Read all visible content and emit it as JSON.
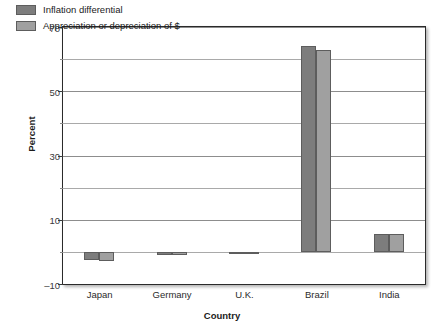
{
  "chart_data": {
    "type": "bar",
    "title": "",
    "xlabel": "Country",
    "ylabel": "Percent",
    "categories": [
      "Japan",
      "Germany",
      "U.K.",
      "Brazil",
      "India"
    ],
    "series": [
      {
        "name": "Inflation differential",
        "color": "#7d7d7d",
        "values": [
          -2.5,
          -1.0,
          -0.4,
          64.0,
          5.5
        ]
      },
      {
        "name": "Appreciation or depreciation of $",
        "color": "#a0a0a0",
        "values": [
          -2.7,
          -1.1,
          -0.4,
          62.8,
          5.6
        ]
      }
    ],
    "ylim": [
      -10,
      70
    ],
    "yticks_major": [
      70,
      50,
      30,
      10,
      -10
    ],
    "yticks_minor": [
      60,
      40,
      20,
      0
    ],
    "grid": true,
    "legend_position": "top-left"
  },
  "legend": {
    "items": [
      {
        "label": "Inflation differential"
      },
      {
        "label": "Appreciation or depreciation of $"
      }
    ]
  },
  "axes": {
    "y_title": "Percent",
    "x_title": "Country",
    "y_tick_labels": [
      "70",
      "50",
      "30",
      "10",
      "–10"
    ],
    "x_tick_labels": [
      "Japan",
      "Germany",
      "U.K.",
      "Brazil",
      "India"
    ]
  }
}
